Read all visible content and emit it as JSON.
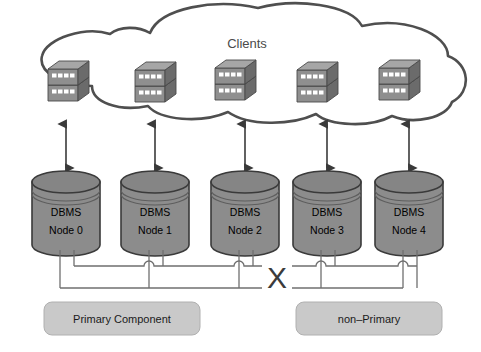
{
  "diagram": {
    "background_color": "#ffffff",
    "cloud": {
      "label": "Clients",
      "stroke_color": "#4f4f4f",
      "fill_color": "#ffffff",
      "client_icon_name": "server-stack-icon",
      "client_count": 5
    },
    "nodes": [
      {
        "line1": "DBMS",
        "line2": "Node 0",
        "group": "primary"
      },
      {
        "line1": "DBMS",
        "line2": "Node 1",
        "group": "primary"
      },
      {
        "line1": "DBMS",
        "line2": "Node 2",
        "group": "primary"
      },
      {
        "line1": "DBMS",
        "line2": "Node 3",
        "group": "non-primary"
      },
      {
        "line1": "DBMS",
        "line2": "Node 4",
        "group": "non-primary"
      }
    ],
    "node_style": {
      "body_color": "#8c8c8c",
      "top_color": "#828282",
      "stroke_color": "#3a3a3a",
      "text_color": "#000000"
    },
    "link_break": {
      "marker": "X",
      "color": "#3b3b3b"
    },
    "wire_color": "#6f6f6f",
    "arrow_color": "#3a3a3a",
    "groups": [
      {
        "label": "Primary Component",
        "fill_color": "#c9c9c9",
        "border_color": "#b0b0b0"
      },
      {
        "label": "non–Primary",
        "fill_color": "#c9c9c9",
        "border_color": "#b0b0b0"
      }
    ]
  }
}
